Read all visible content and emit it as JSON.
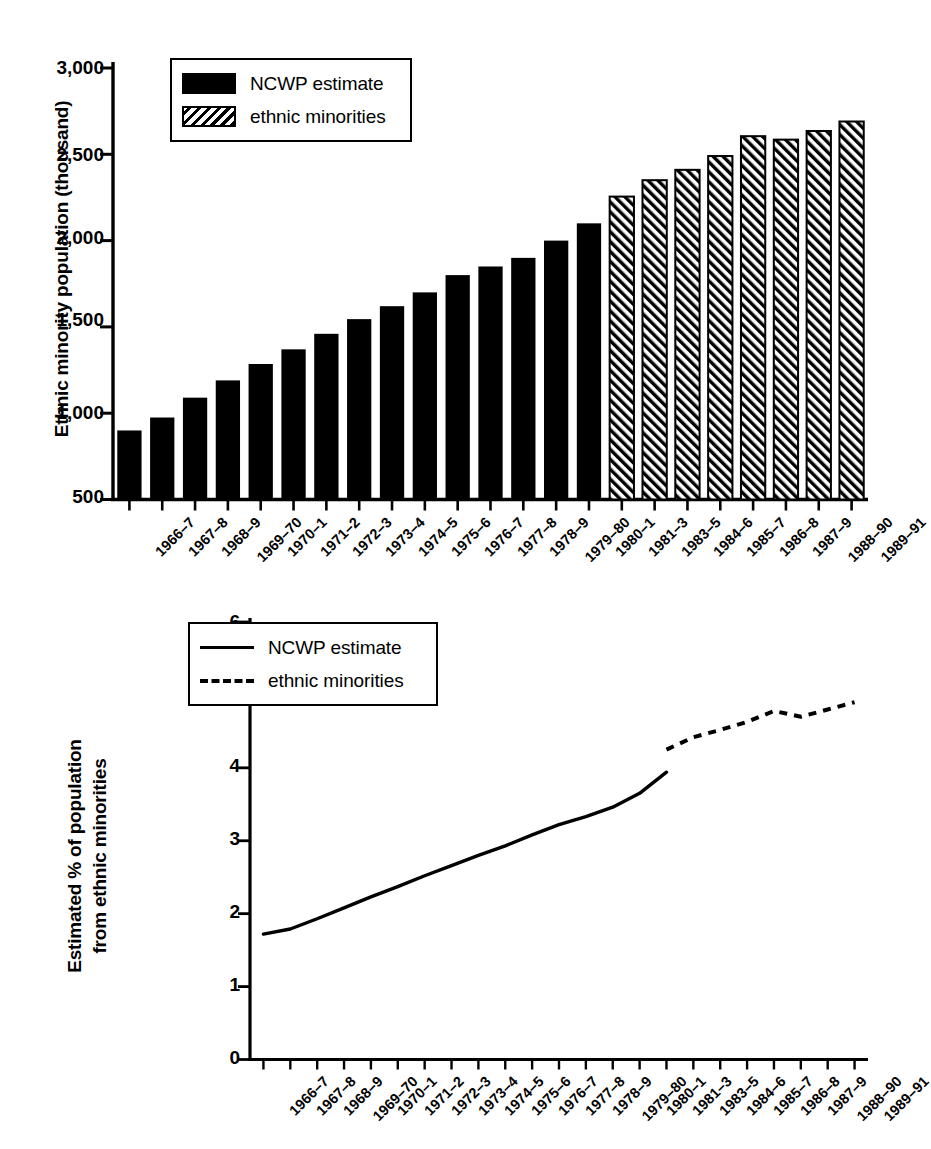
{
  "figure": {
    "background": "#ffffff",
    "ink_color": "#000000"
  },
  "chart_data": [
    {
      "type": "bar",
      "panel": "top",
      "title": "",
      "xlabel": "",
      "ylabel": "Ethnic minority population (thousand)",
      "ylim": [
        500,
        3000
      ],
      "yticks": [
        "500",
        "1,000",
        "1,500",
        "2,000",
        "2,500",
        "3,000"
      ],
      "ytick_values": [
        500,
        1000,
        1500,
        2000,
        2500,
        3000
      ],
      "grid": false,
      "legend_position": "upper-left-inside",
      "categories": [
        "1966–7",
        "1967–8",
        "1968–9",
        "1969–70",
        "1970–1",
        "1971–2",
        "1972–3",
        "1973–4",
        "1974–5",
        "1975–6",
        "1976–7",
        "1977–8",
        "1978–9",
        "1979–80",
        "1980–1",
        "1981–3",
        "1983–5",
        "1984–6",
        "1985–7",
        "1986–8",
        "1987–9",
        "1988–90",
        "1989–91"
      ],
      "series": [
        {
          "name": "NCWP estimate",
          "style": "solid-fill",
          "values": [
            900,
            975,
            1090,
            1190,
            1285,
            1370,
            1460,
            1545,
            1620,
            1700,
            1800,
            1850,
            1900,
            2000,
            2100,
            null,
            null,
            null,
            null,
            null,
            null,
            null,
            null
          ]
        },
        {
          "name": "ethnic minorities",
          "style": "hatched-fill",
          "values": [
            null,
            null,
            null,
            null,
            null,
            null,
            null,
            null,
            null,
            null,
            null,
            null,
            null,
            null,
            null,
            2255,
            2350,
            2410,
            2490,
            2605,
            2585,
            2635,
            2690
          ]
        }
      ]
    },
    {
      "type": "line",
      "panel": "bottom",
      "title": "",
      "xlabel": "",
      "ylabel": "Estimated % of population from ethnic minorities",
      "ylim": [
        0,
        6
      ],
      "yticks": [
        "0",
        "1",
        "2",
        "3",
        "4",
        "5",
        "6"
      ],
      "ytick_values": [
        0,
        1,
        2,
        3,
        4,
        5,
        6
      ],
      "grid": false,
      "legend_position": "upper-left-inside",
      "categories": [
        "1966–7",
        "1967–8",
        "1968–9",
        "1969–70",
        "1970–1",
        "1971–2",
        "1972–3",
        "1973–4",
        "1974–5",
        "1975–6",
        "1976–7",
        "1977–8",
        "1978–9",
        "1979–80",
        "1980–1",
        "1981–3",
        "1983–5",
        "1984–6",
        "1985–7",
        "1986–8",
        "1987–9",
        "1988–90",
        "1989–91"
      ],
      "series": [
        {
          "name": "NCWP estimate",
          "style": "solid-line",
          "values": [
            1.72,
            1.79,
            1.93,
            2.08,
            2.23,
            2.37,
            2.52,
            2.66,
            2.8,
            2.93,
            3.08,
            3.22,
            3.33,
            3.46,
            3.65,
            3.94,
            null,
            null,
            null,
            null,
            null,
            null,
            null
          ]
        },
        {
          "name": "ethnic minorities",
          "style": "dashed-line",
          "values": [
            null,
            null,
            null,
            null,
            null,
            null,
            null,
            null,
            null,
            null,
            null,
            null,
            null,
            null,
            null,
            4.25,
            4.42,
            4.52,
            4.63,
            4.78,
            4.7,
            4.8,
            4.9
          ]
        }
      ]
    }
  ],
  "bar_panel": {
    "y_axis_title": "Ethnic minority population (thousand)",
    "legend": {
      "entries": [
        {
          "label": "NCWP estimate",
          "swatch": "solid-black-rect"
        },
        {
          "label": "ethnic minorities",
          "swatch": "hatched-rect"
        }
      ]
    }
  },
  "line_panel": {
    "y_axis_title_line1": "Estimated % of population",
    "y_axis_title_line2": "from ethnic minorities",
    "legend": {
      "entries": [
        {
          "label": "NCWP estimate",
          "swatch": "solid-line"
        },
        {
          "label": "ethnic minorities",
          "swatch": "dashed-line"
        }
      ]
    }
  }
}
